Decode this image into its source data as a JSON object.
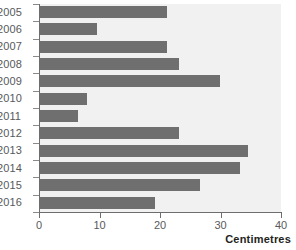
{
  "chart_data": {
    "type": "bar",
    "orientation": "horizontal",
    "title": "",
    "xlabel": "Centimetres",
    "ylabel": "",
    "categories": [
      "2005",
      "2006",
      "2007",
      "2008",
      "2009",
      "2010",
      "2011",
      "2012",
      "2013",
      "2014",
      "2015",
      "2016"
    ],
    "values": [
      21.2,
      9.6,
      21.2,
      23.1,
      29.9,
      7.9,
      6.4,
      23.1,
      34.5,
      33.2,
      26.6,
      19.2
    ],
    "xlim": [
      0,
      40
    ],
    "xticks": [
      0,
      10,
      20,
      30,
      40
    ],
    "xtick_labels": [
      "0",
      "10",
      "20",
      "30",
      "40"
    ],
    "grid": false,
    "legend": null,
    "bar_color": "#6f6f6f",
    "plot_background": "#f1f1f1",
    "axis_color": "#6d6d6d",
    "label_color": "#58595b"
  }
}
